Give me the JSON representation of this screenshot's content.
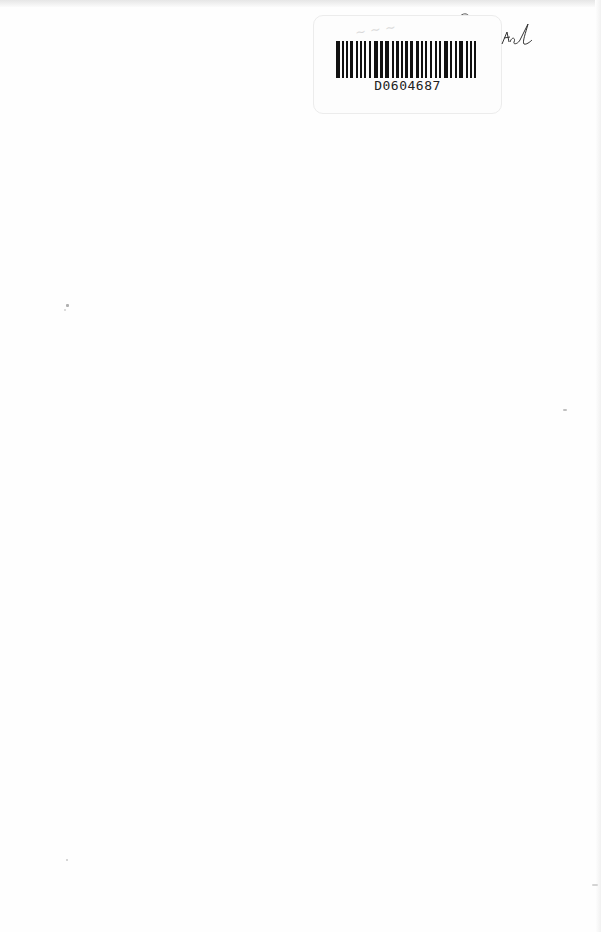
{
  "document": {
    "type": "scanned-blank-page",
    "barcode": {
      "text": "D0604687"
    },
    "handwriting": {
      "signature_note": "handwritten initials"
    }
  },
  "colors": {
    "paper": "#fefefe",
    "ink": "#111111",
    "sticker_border": "#ececec"
  }
}
